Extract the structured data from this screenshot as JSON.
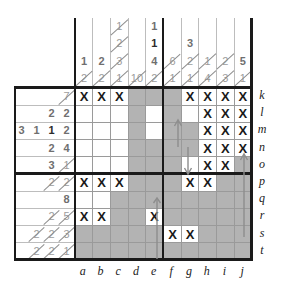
{
  "puzzle": {
    "title": "Nonogram grid",
    "type": "nonogram",
    "width": 10,
    "height": 10,
    "col_labels": [
      "a",
      "b",
      "c",
      "d",
      "e",
      "f",
      "g",
      "h",
      "i",
      "j"
    ],
    "row_labels": [
      "k",
      "l",
      "m",
      "n",
      "o",
      "p",
      "q",
      "r",
      "s",
      "t"
    ],
    "colors": {
      "filled": "#b3b3b3",
      "filled_alt": "#c4c4c4",
      "empty": "#ffffff",
      "grid_line": "#9a9a9a",
      "heavy_line": "#1a1a1a",
      "clue_text": "#9d9d9d",
      "clue_text_active": "#2b2b2b",
      "mark_text": "#1a1a1a",
      "arrow": "#8d8d8d"
    },
    "mark_glyph": "X",
    "column_clues": [
      {
        "label": "a",
        "values": [
          "1",
          "2"
        ],
        "struck": [
          false,
          true
        ]
      },
      {
        "label": "b",
        "values": [
          "2",
          "2"
        ],
        "struck": [
          false,
          true
        ]
      },
      {
        "label": "c",
        "values": [
          "1",
          "2",
          "3",
          "1"
        ],
        "struck": [
          true,
          true,
          true,
          true
        ]
      },
      {
        "label": "d",
        "values": [
          "10"
        ],
        "struck": [
          true
        ]
      },
      {
        "label": "e",
        "values": [
          "1",
          "1",
          "4",
          "2"
        ],
        "struck": [
          false,
          false,
          false,
          true
        ]
      },
      {
        "label": "f",
        "values": [
          "6",
          "1"
        ],
        "struck": [
          true,
          true
        ]
      },
      {
        "label": "g",
        "values": [
          "3",
          "2",
          "1"
        ],
        "struck": [
          false,
          true,
          true
        ]
      },
      {
        "label": "h",
        "values": [
          "1",
          "4"
        ],
        "struck": [
          true,
          true
        ]
      },
      {
        "label": "i",
        "values": [
          "2",
          "3"
        ],
        "struck": [
          true,
          true
        ]
      },
      {
        "label": "j",
        "values": [
          "5",
          "1"
        ],
        "struck": [
          false,
          true
        ]
      }
    ],
    "row_clues": [
      {
        "label": "k",
        "values": [
          "7"
        ],
        "struck": [
          true
        ]
      },
      {
        "label": "l",
        "values": [
          "2",
          "2"
        ],
        "struck": [
          false,
          false
        ]
      },
      {
        "label": "m",
        "values": [
          "3",
          "1",
          "1",
          "2"
        ],
        "struck": [
          false,
          false,
          false,
          false
        ]
      },
      {
        "label": "n",
        "values": [
          "2",
          "4"
        ],
        "struck": [
          false,
          false
        ]
      },
      {
        "label": "o",
        "values": [
          "3",
          "1"
        ],
        "struck": [
          false,
          true
        ]
      },
      {
        "label": "p",
        "values": [
          "2",
          "2"
        ],
        "struck": [
          true,
          true
        ]
      },
      {
        "label": "q",
        "values": [
          "8"
        ],
        "struck": [
          false
        ]
      },
      {
        "label": "r",
        "values": [
          "2",
          "5"
        ],
        "struck": [
          true,
          true
        ]
      },
      {
        "label": "s",
        "values": [
          "2",
          "2",
          "3"
        ],
        "struck": [
          true,
          true,
          true
        ]
      },
      {
        "label": "t",
        "values": [
          "2",
          "2",
          "1"
        ],
        "struck": [
          true,
          true,
          true
        ]
      }
    ],
    "cells": [
      [
        "mark",
        "mark",
        "mark",
        "fill",
        "fill",
        "fill",
        "mark",
        "mark",
        "mark",
        "mark"
      ],
      [
        "empty",
        "empty",
        "empty",
        "fill",
        "empty",
        "fill",
        "empty",
        "mark",
        "mark",
        "mark"
      ],
      [
        "empty",
        "empty",
        "empty",
        "fill",
        "empty",
        "fill",
        "fill",
        "mark",
        "mark",
        "mark"
      ],
      [
        "empty",
        "empty",
        "empty",
        "fill",
        "fill",
        "fill",
        "fill",
        "mark",
        "mark",
        "mark"
      ],
      [
        "empty",
        "empty",
        "empty",
        "fill",
        "fill",
        "fill",
        "empty",
        "mark",
        "mark",
        "fill"
      ],
      [
        "mark",
        "mark",
        "mark",
        "fill",
        "fill",
        "fill",
        "mark",
        "mark",
        "fill",
        "fill"
      ],
      [
        "empty",
        "empty",
        "fill",
        "fill",
        "fill",
        "fill",
        "fill",
        "fill",
        "fill",
        "fill"
      ],
      [
        "mark",
        "mark",
        "fill",
        "fill",
        "mark",
        "fill",
        "fill",
        "fill",
        "fill",
        "fill"
      ],
      [
        "fill",
        "fill",
        "fill",
        "fill",
        "fill",
        "mark",
        "mark",
        "fill",
        "fill",
        "fill"
      ],
      [
        "fill",
        "fill",
        "fill",
        "fill",
        "fill",
        "fill",
        "fill",
        "fill",
        "fill",
        "fill"
      ]
    ]
  }
}
